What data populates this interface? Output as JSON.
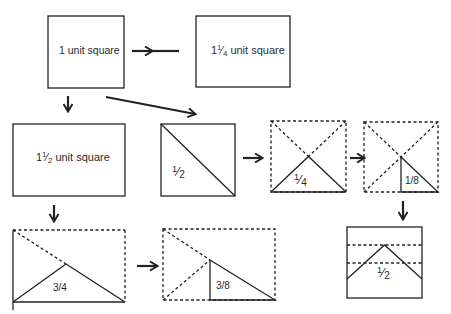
{
  "diagram": {
    "stroke_color": "#222222",
    "background": "#ffffff",
    "boxes": [
      {
        "id": "box-1-unit-square",
        "label": "1 unit square",
        "style": "solid"
      },
      {
        "id": "box-1-and-quarter-unit-square",
        "label_whole": "1",
        "label_num": "1",
        "label_den": "4",
        "label_suffix": " unit square",
        "style": "solid"
      },
      {
        "id": "box-1-and-half-unit-square",
        "label_whole": "1",
        "label_num": "1",
        "label_den": "2",
        "label_suffix": " unit square",
        "style": "solid"
      },
      {
        "id": "box-half-diagonal",
        "label_num": "1",
        "label_den": "2",
        "style": "solid"
      },
      {
        "id": "box-quarter-triangle",
        "label_num": "1",
        "label_den": "4",
        "style": "dashed"
      },
      {
        "id": "box-eighth-triangle",
        "label": "1/8",
        "style": "dashed"
      },
      {
        "id": "box-half-folded",
        "label_num": "1",
        "label_den": "2",
        "style": "solid"
      },
      {
        "id": "rect-three-quarter-triangle",
        "label": "3/4",
        "style": "mixed"
      },
      {
        "id": "rect-three-eighth-triangle",
        "label": "3/8",
        "style": "dashed"
      }
    ],
    "arrows": [
      {
        "from": "box-1-unit-square",
        "to": "box-1-and-quarter-unit-square",
        "direction": "right"
      },
      {
        "from": "box-1-unit-square",
        "to": "box-1-and-half-unit-square",
        "direction": "down"
      },
      {
        "from": "box-1-unit-square",
        "to": "box-half-diagonal",
        "direction": "diagonal"
      },
      {
        "from": "box-half-diagonal",
        "to": "box-quarter-triangle",
        "direction": "right"
      },
      {
        "from": "box-quarter-triangle",
        "to": "box-eighth-triangle",
        "direction": "right"
      },
      {
        "from": "box-eighth-triangle",
        "to": "box-half-folded",
        "direction": "down"
      },
      {
        "from": "box-1-and-half-unit-square",
        "to": "rect-three-quarter-triangle",
        "direction": "down"
      },
      {
        "from": "rect-three-quarter-triangle",
        "to": "rect-three-eighth-triangle",
        "direction": "right"
      }
    ]
  }
}
